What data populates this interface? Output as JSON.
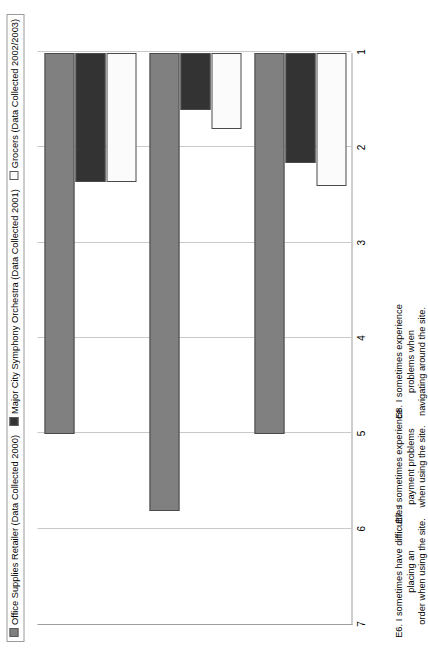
{
  "chart_data": {
    "type": "bar",
    "orientation": "horizontal",
    "title": "",
    "xlabel": "",
    "ylabel": "",
    "xlim": [
      1,
      7
    ],
    "ticks": [
      7,
      6,
      5,
      4,
      3,
      2,
      1
    ],
    "grid": true,
    "legend_position": "top",
    "categories": [
      "E6. I sometimes have difficulties placing an order when using the site.",
      "E7. I sometimes experience payment problems when using the site.",
      "E8. I sometimes experience  problems when navigating around the site."
    ],
    "series": [
      {
        "name": "Office Supplies Retailer (Data Collected 2000)",
        "swatch": "gray",
        "color": "#808080",
        "values": [
          5.0,
          5.8,
          5.0
        ]
      },
      {
        "name": "Major City  Symphony Orchestra (Data Collected 2001)",
        "swatch": "dark",
        "color": "#333333",
        "values": [
          2.35,
          1.6,
          2.15
        ]
      },
      {
        "name": "Grocers (Data Collected 2002/2003)",
        "swatch": "white",
        "color": "#fbfbfb",
        "values": [
          2.35,
          1.8,
          2.4
        ]
      }
    ]
  },
  "legend": {
    "items": [
      {
        "label": "Office Supplies Retailer (Data Collected 2000)"
      },
      {
        "label": "Major City  Symphony Orchestra (Data Collected 2001)"
      },
      {
        "label": "Grocers (Data Collected 2002/2003)"
      }
    ]
  },
  "axis": {
    "tick_labels": [
      "7",
      "6",
      "5",
      "4",
      "3",
      "2",
      "1"
    ]
  },
  "category_labels": [
    {
      "line1": "E6. I sometimes have difficulties placing an",
      "line2": "order when using the site."
    },
    {
      "line1": "E7. I sometimes experience payment problems",
      "line2": "when using the site."
    },
    {
      "line1": "E8. I sometimes experience  problems when",
      "line2": "navigating around the site."
    }
  ]
}
